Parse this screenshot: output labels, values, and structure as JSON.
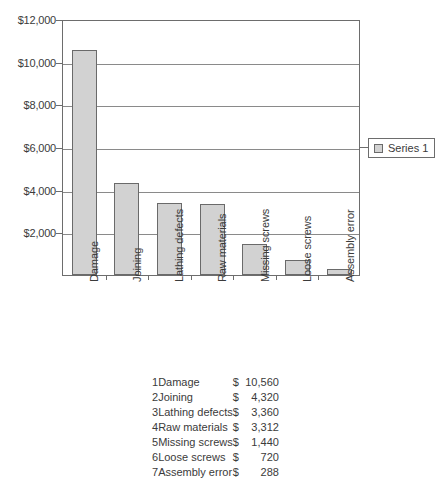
{
  "chart_data": {
    "type": "bar",
    "title": "",
    "xlabel": "",
    "ylabel": "",
    "categories": [
      "Damage",
      "Joining",
      "Lathing defects",
      "Raw materials",
      "Missing screws",
      "Loose screws",
      "Assembly error"
    ],
    "values": [
      10560,
      4320,
      3360,
      3312,
      1440,
      720,
      288
    ],
    "series": [
      {
        "name": "Series 1",
        "values": [
          10560,
          4320,
          3360,
          3312,
          1440,
          720,
          288
        ]
      }
    ],
    "ylim": [
      0,
      12000
    ],
    "ytick_values": [
      0,
      2000,
      4000,
      6000,
      8000,
      10000,
      12000
    ],
    "ytick_labels": [
      "",
      "$2,000",
      "$4,000",
      "$6,000",
      "$8,000",
      "$10,000",
      "$12,000"
    ],
    "grid": true,
    "legend_position": "right",
    "bar_color": "#d2d2d2",
    "bar_border_color": "#6a6a6a",
    "axis_color": "#6d6d6d",
    "gridline_color": "#8a8a8a",
    "text_color": "#3b3b3b"
  },
  "legend": {
    "entries": [
      {
        "label": "Series 1",
        "swatch_color": "#d2d2d2"
      }
    ]
  },
  "table": {
    "rows": [
      {
        "index": "1",
        "name": "Damage",
        "currency": "$",
        "amount": "10,560"
      },
      {
        "index": "2",
        "name": "Joining",
        "currency": "$",
        "amount": "4,320"
      },
      {
        "index": "3",
        "name": "Lathing defects",
        "currency": "$",
        "amount": "3,360"
      },
      {
        "index": "4",
        "name": "Raw materials",
        "currency": "$",
        "amount": "3,312"
      },
      {
        "index": "5",
        "name": "Missing screws",
        "currency": "$",
        "amount": "1,440"
      },
      {
        "index": "6",
        "name": "Loose screws",
        "currency": "$",
        "amount": "720"
      },
      {
        "index": "7",
        "name": "Assembly error",
        "currency": "$",
        "amount": "288"
      }
    ]
  }
}
